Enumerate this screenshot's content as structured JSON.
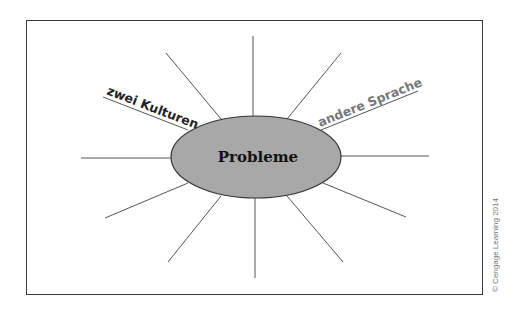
{
  "diagram": {
    "type": "mind-map",
    "center": {
      "label": "Probleme",
      "fill": "#a8a8a8"
    },
    "branches": [
      {
        "id": "upper-left",
        "label": "zwei Kulturen",
        "color": "#222222"
      },
      {
        "id": "upper-right",
        "label": "andere Sprache",
        "color": "#777777"
      }
    ],
    "empty_branch_count": 10
  },
  "copyright": "© Cengage Learning 2014"
}
